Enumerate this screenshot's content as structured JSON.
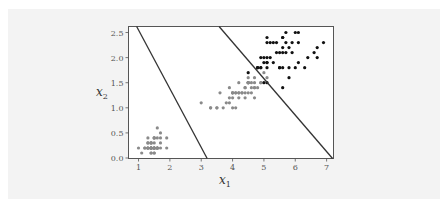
{
  "chart_data": {
    "type": "scatter",
    "title": "",
    "xlabel": "x1",
    "ylabel": "x2",
    "xlim": [
      0.68,
      7.22
    ],
    "ylim": [
      -0.01,
      2.62
    ],
    "grid": false,
    "legend": null,
    "x_ticks": [
      1,
      2,
      3,
      4,
      5,
      6,
      7
    ],
    "x_tick_labels": [
      "1",
      "2",
      "3",
      "4",
      "5",
      "6",
      "7"
    ],
    "y_ticks": [
      0.0,
      0.5,
      1.0,
      1.5,
      2.0,
      2.5
    ],
    "y_tick_labels": [
      "0.0",
      "0.5",
      "1.0",
      "1.5",
      "2.0",
      "2.5"
    ],
    "series": [
      {
        "name": "class-gray (setosa + versicolor)",
        "color": "#8a8a8a",
        "points": [
          [
            1.4,
            0.2
          ],
          [
            1.4,
            0.2
          ],
          [
            1.3,
            0.2
          ],
          [
            1.5,
            0.2
          ],
          [
            1.4,
            0.2
          ],
          [
            1.7,
            0.4
          ],
          [
            1.4,
            0.3
          ],
          [
            1.5,
            0.2
          ],
          [
            1.4,
            0.2
          ],
          [
            1.5,
            0.1
          ],
          [
            1.5,
            0.2
          ],
          [
            1.6,
            0.2
          ],
          [
            1.4,
            0.1
          ],
          [
            1.1,
            0.1
          ],
          [
            1.2,
            0.2
          ],
          [
            1.5,
            0.4
          ],
          [
            1.3,
            0.4
          ],
          [
            1.4,
            0.3
          ],
          [
            1.7,
            0.3
          ],
          [
            1.5,
            0.3
          ],
          [
            1.7,
            0.2
          ],
          [
            1.5,
            0.4
          ],
          [
            1.0,
            0.2
          ],
          [
            1.7,
            0.5
          ],
          [
            1.9,
            0.2
          ],
          [
            1.6,
            0.2
          ],
          [
            1.6,
            0.4
          ],
          [
            1.5,
            0.2
          ],
          [
            1.4,
            0.2
          ],
          [
            1.6,
            0.2
          ],
          [
            1.6,
            0.2
          ],
          [
            1.5,
            0.4
          ],
          [
            1.5,
            0.1
          ],
          [
            1.4,
            0.2
          ],
          [
            1.5,
            0.2
          ],
          [
            1.2,
            0.2
          ],
          [
            1.3,
            0.2
          ],
          [
            1.4,
            0.1
          ],
          [
            1.3,
            0.2
          ],
          [
            1.5,
            0.2
          ],
          [
            1.3,
            0.3
          ],
          [
            1.3,
            0.3
          ],
          [
            1.3,
            0.2
          ],
          [
            1.6,
            0.6
          ],
          [
            1.9,
            0.4
          ],
          [
            1.4,
            0.3
          ],
          [
            1.6,
            0.2
          ],
          [
            1.4,
            0.2
          ],
          [
            1.5,
            0.2
          ],
          [
            1.4,
            0.2
          ],
          [
            4.7,
            1.4
          ],
          [
            4.5,
            1.5
          ],
          [
            4.9,
            1.5
          ],
          [
            4.0,
            1.3
          ],
          [
            4.6,
            1.5
          ],
          [
            4.5,
            1.3
          ],
          [
            4.7,
            1.6
          ],
          [
            3.3,
            1.0
          ],
          [
            4.6,
            1.3
          ],
          [
            3.9,
            1.4
          ],
          [
            3.5,
            1.0
          ],
          [
            4.2,
            1.5
          ],
          [
            4.0,
            1.0
          ],
          [
            4.7,
            1.4
          ],
          [
            3.6,
            1.3
          ],
          [
            4.4,
            1.4
          ],
          [
            4.5,
            1.5
          ],
          [
            4.1,
            1.0
          ],
          [
            4.5,
            1.5
          ],
          [
            3.9,
            1.1
          ],
          [
            4.8,
            1.8
          ],
          [
            4.0,
            1.3
          ],
          [
            4.9,
            1.5
          ],
          [
            4.7,
            1.2
          ],
          [
            4.3,
            1.3
          ],
          [
            4.4,
            1.4
          ],
          [
            4.8,
            1.4
          ],
          [
            5.0,
            1.7
          ],
          [
            4.5,
            1.5
          ],
          [
            3.5,
            1.0
          ],
          [
            3.8,
            1.1
          ],
          [
            3.7,
            1.0
          ],
          [
            3.9,
            1.2
          ],
          [
            5.1,
            1.6
          ],
          [
            4.5,
            1.5
          ],
          [
            4.5,
            1.6
          ],
          [
            4.7,
            1.5
          ],
          [
            4.4,
            1.3
          ],
          [
            4.1,
            1.3
          ],
          [
            4.0,
            1.3
          ],
          [
            4.4,
            1.2
          ],
          [
            4.6,
            1.4
          ],
          [
            4.0,
            1.2
          ],
          [
            3.3,
            1.0
          ],
          [
            4.2,
            1.3
          ],
          [
            4.2,
            1.2
          ],
          [
            4.2,
            1.3
          ],
          [
            4.3,
            1.3
          ],
          [
            3.0,
            1.1
          ],
          [
            4.1,
            1.3
          ]
        ]
      },
      {
        "name": "class-black (virginica)",
        "color": "#111111",
        "points": [
          [
            6.0,
            2.5
          ],
          [
            5.1,
            1.9
          ],
          [
            5.9,
            2.1
          ],
          [
            5.6,
            1.8
          ],
          [
            5.8,
            2.2
          ],
          [
            6.6,
            2.1
          ],
          [
            4.5,
            1.7
          ],
          [
            6.3,
            1.8
          ],
          [
            5.8,
            1.8
          ],
          [
            6.1,
            2.5
          ],
          [
            5.1,
            2.0
          ],
          [
            5.3,
            1.9
          ],
          [
            5.5,
            2.1
          ],
          [
            5.0,
            2.0
          ],
          [
            5.1,
            2.4
          ],
          [
            5.3,
            2.3
          ],
          [
            5.5,
            1.8
          ],
          [
            6.7,
            2.2
          ],
          [
            6.9,
            2.3
          ],
          [
            5.0,
            1.5
          ],
          [
            5.7,
            2.3
          ],
          [
            4.9,
            2.0
          ],
          [
            6.7,
            2.0
          ],
          [
            4.9,
            1.8
          ],
          [
            5.7,
            2.1
          ],
          [
            6.0,
            1.8
          ],
          [
            4.8,
            1.8
          ],
          [
            4.9,
            1.8
          ],
          [
            5.6,
            2.1
          ],
          [
            5.8,
            1.6
          ],
          [
            6.1,
            1.9
          ],
          [
            6.4,
            2.0
          ],
          [
            5.6,
            2.2
          ],
          [
            5.1,
            1.5
          ],
          [
            5.6,
            1.4
          ],
          [
            6.1,
            2.3
          ],
          [
            5.6,
            2.4
          ],
          [
            5.5,
            1.8
          ],
          [
            4.8,
            1.8
          ],
          [
            5.4,
            2.1
          ],
          [
            5.6,
            2.4
          ],
          [
            5.1,
            2.3
          ],
          [
            5.1,
            1.9
          ],
          [
            5.9,
            2.3
          ],
          [
            5.7,
            2.5
          ],
          [
            5.2,
            2.3
          ],
          [
            5.0,
            1.9
          ],
          [
            5.2,
            2.0
          ],
          [
            5.4,
            2.3
          ],
          [
            5.1,
            1.8
          ]
        ]
      }
    ],
    "lines": [
      {
        "name": "decision-boundary-1",
        "color": "#333333",
        "x": [
          0.94,
          3.19
        ],
        "y": [
          2.62,
          -0.01
        ]
      },
      {
        "name": "decision-boundary-2",
        "color": "#333333",
        "x": [
          3.57,
          7.19
        ],
        "y": [
          2.62,
          -0.01
        ]
      }
    ]
  },
  "axes": {
    "xlabel_main": "x",
    "xlabel_sub": "1",
    "ylabel_main": "x",
    "ylabel_sub": "2"
  }
}
